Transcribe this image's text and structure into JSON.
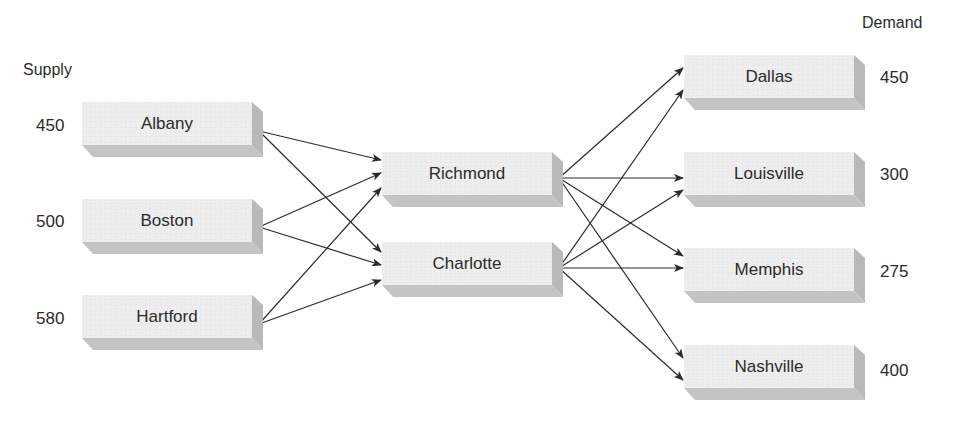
{
  "headings": {
    "supply": "Supply",
    "demand": "Demand"
  },
  "sources": [
    {
      "name": "Albany",
      "supply": "450"
    },
    {
      "name": "Boston",
      "supply": "500"
    },
    {
      "name": "Hartford",
      "supply": "580"
    }
  ],
  "transshipment": [
    {
      "name": "Richmond"
    },
    {
      "name": "Charlotte"
    }
  ],
  "destinations": [
    {
      "name": "Dallas",
      "demand": "450"
    },
    {
      "name": "Louisville",
      "demand": "300"
    },
    {
      "name": "Memphis",
      "demand": "275"
    },
    {
      "name": "Nashville",
      "demand": "400"
    }
  ],
  "edges": [
    {
      "from": "Albany",
      "to": "Richmond"
    },
    {
      "from": "Albany",
      "to": "Charlotte"
    },
    {
      "from": "Boston",
      "to": "Richmond"
    },
    {
      "from": "Boston",
      "to": "Charlotte"
    },
    {
      "from": "Hartford",
      "to": "Richmond"
    },
    {
      "from": "Hartford",
      "to": "Charlotte"
    },
    {
      "from": "Richmond",
      "to": "Dallas"
    },
    {
      "from": "Richmond",
      "to": "Louisville"
    },
    {
      "from": "Richmond",
      "to": "Memphis"
    },
    {
      "from": "Richmond",
      "to": "Nashville"
    },
    {
      "from": "Charlotte",
      "to": "Dallas"
    },
    {
      "from": "Charlotte",
      "to": "Louisville"
    },
    {
      "from": "Charlotte",
      "to": "Memphis"
    },
    {
      "from": "Charlotte",
      "to": "Nashville"
    }
  ],
  "colors": {
    "box_face": "#eeeeee",
    "box_side": "#b9b9b9",
    "box_bottom": "#c4c4c4",
    "arrow": "#2b2b2b",
    "text": "#2b2b2b"
  }
}
